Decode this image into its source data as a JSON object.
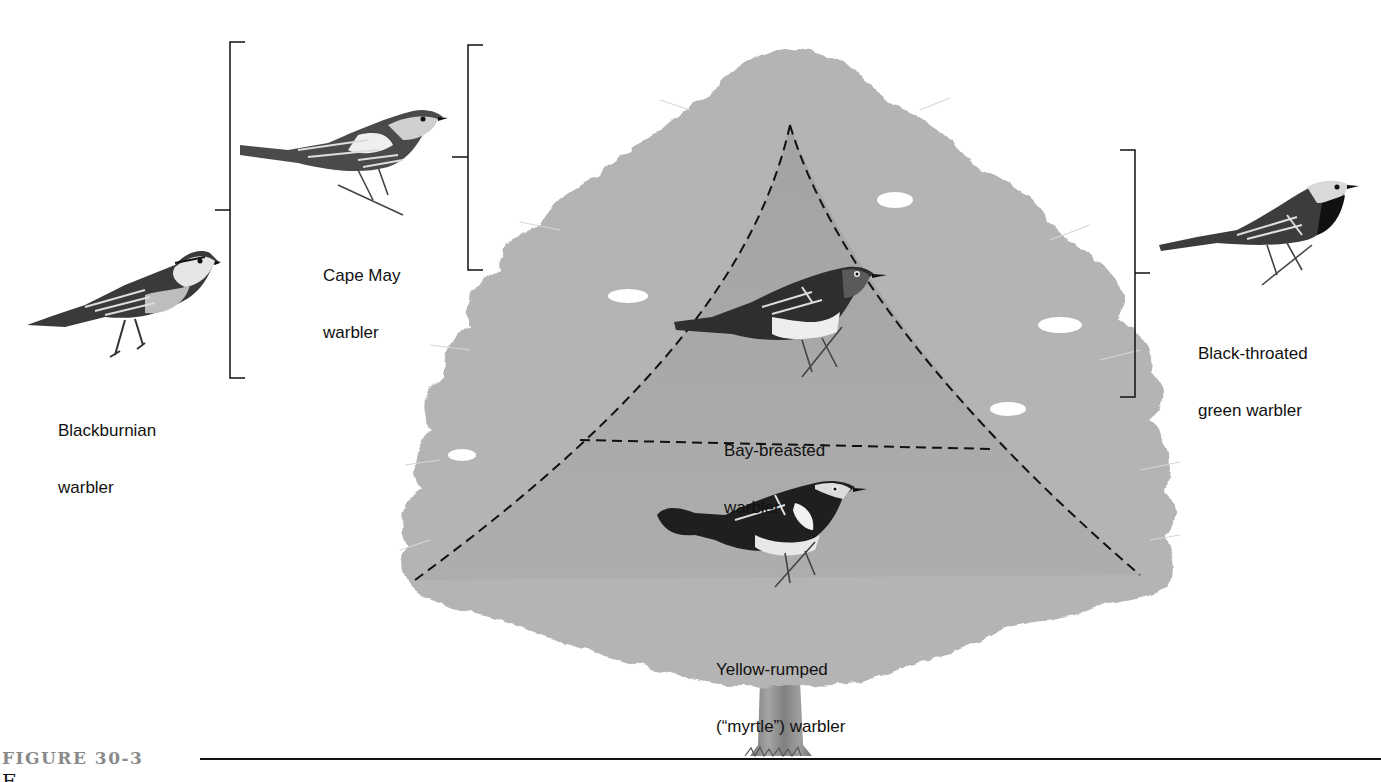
{
  "figure": {
    "number": "FIGURE 30-3",
    "caption_fragment": "F"
  },
  "tree": {
    "foliage_color": "#b3b3b3",
    "inner_zone_color": "#a6a6a6",
    "trunk_color": "#8d8d8d"
  },
  "zones": [
    {
      "id": "upper",
      "species": "Bay-breasted warbler"
    },
    {
      "id": "lower",
      "species": "Yellow-rumped (\"myrtle\") warbler"
    }
  ],
  "birds": [
    {
      "id": "blackburnian",
      "label_line1": "Blackburnian",
      "label_line2": "warbler",
      "position": "outer left, wide bracket"
    },
    {
      "id": "cape-may",
      "label_line1": "Cape May",
      "label_line2": "warbler",
      "position": "upper left, treetop bracket"
    },
    {
      "id": "bay-breasted",
      "label_line1": "Bay-breasted",
      "label_line2": "warbler",
      "position": "inner upper zone"
    },
    {
      "id": "yellow-rumped",
      "label_line1": "Yellow-rumped",
      "label_line2": "(“myrtle”) warbler",
      "position": "inner lower zone"
    },
    {
      "id": "black-throated-green",
      "label_line1": "Black-throated",
      "label_line2": "green warbler",
      "position": "right, outer mid bracket"
    }
  ],
  "brackets": [
    {
      "id": "blackburnian-bracket",
      "side": "left"
    },
    {
      "id": "cape-may-bracket",
      "side": "left"
    },
    {
      "id": "black-throated-green-bracket",
      "side": "right"
    }
  ],
  "style": {
    "line_color": "#111111",
    "caption_number_color": "#8a8a8a"
  }
}
